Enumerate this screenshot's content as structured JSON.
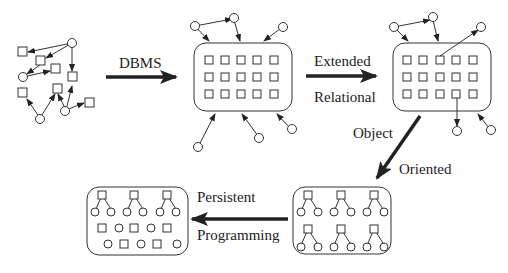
{
  "diagram": {
    "stages": [
      {
        "id": "files",
        "label": "Scattered objects (file-based)"
      },
      {
        "id": "dbms",
        "label": "DBMS"
      },
      {
        "id": "extended-relational",
        "label": "Extended Relational"
      },
      {
        "id": "object-oriented",
        "label": "Object Oriented"
      },
      {
        "id": "persistent-programming",
        "label": "Persistent Programming"
      }
    ],
    "arrows": {
      "dbms": "DBMS",
      "extended": "Extended",
      "relational": "Relational",
      "object": "Object",
      "oriented": "Oriented",
      "persistent": "Persistent",
      "programming": "Programming"
    },
    "colors": {
      "stroke": "#333333",
      "arrow": "#222222",
      "background": "#ffffff"
    }
  }
}
